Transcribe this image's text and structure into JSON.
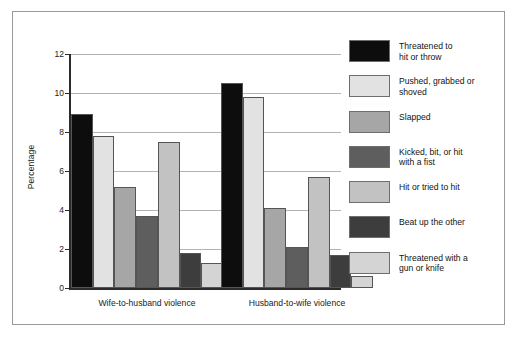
{
  "chart_data": {
    "type": "bar",
    "title": "",
    "xlabel": "",
    "ylabel": "Percentage",
    "ylim": [
      0,
      12
    ],
    "yticks": [
      0,
      2,
      4,
      6,
      8,
      10,
      12
    ],
    "ytick_labels": [
      "0",
      "2",
      "4",
      "6",
      "8",
      "10",
      "12"
    ],
    "grid": true,
    "grouped": true,
    "legend_position": "right",
    "categories": [
      "Wife-to-husband violence",
      "Husband-to-wife violence"
    ],
    "series": [
      {
        "name": "Threatened to\nhit or throw",
        "color": "#0d0d0d",
        "values": [
          8.9,
          10.5
        ]
      },
      {
        "name": "Pushed, grabbed or\nshoved",
        "color": "#e2e2e2",
        "values": [
          7.8,
          9.8
        ]
      },
      {
        "name": "Slapped",
        "color": "#a6a6a6",
        "values": [
          5.2,
          4.1
        ]
      },
      {
        "name": "Kicked, bit, or hit\nwith a fist",
        "color": "#5e5e5e",
        "values": [
          3.7,
          2.1
        ]
      },
      {
        "name": "Hit or tried to hit",
        "color": "#c2c2c2",
        "values": [
          7.5,
          5.7
        ]
      },
      {
        "name": "Beat up the other",
        "color": "#3d3d3d",
        "values": [
          1.8,
          1.7
        ]
      },
      {
        "name": "Threatened with a\ngun or knife",
        "color": "#d4d4d4",
        "values": [
          1.3,
          0.6
        ]
      }
    ]
  },
  "figure": {
    "border_color": "#9a9a9a",
    "background": "#ffffff",
    "axis_color": "#2b2b2b",
    "gridline_color": "#b3b3b3"
  }
}
